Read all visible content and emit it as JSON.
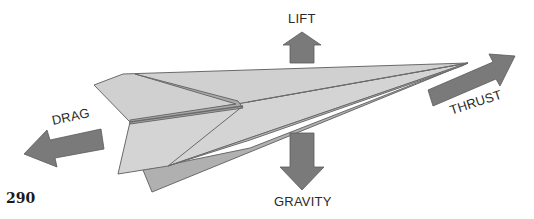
{
  "figure": {
    "forces": [
      {
        "id": "lift",
        "label": "LIFT",
        "direction": "up"
      },
      {
        "id": "gravity",
        "label": "GRAVITY",
        "direction": "down"
      },
      {
        "id": "drag",
        "label": "DRAG",
        "direction": "backward"
      },
      {
        "id": "thrust",
        "label": "THRUST",
        "direction": "forward"
      }
    ]
  },
  "page_number": "290",
  "colors": {
    "arrow": "#7a7a7a",
    "arrow_stroke": "#5a5a5a",
    "plane_light": "#d6d6d6",
    "plane_mid": "#bdbdbd",
    "plane_dark": "#a8a8a8",
    "plane_stroke": "#6a6a6a",
    "text": "#2a2a2a"
  }
}
